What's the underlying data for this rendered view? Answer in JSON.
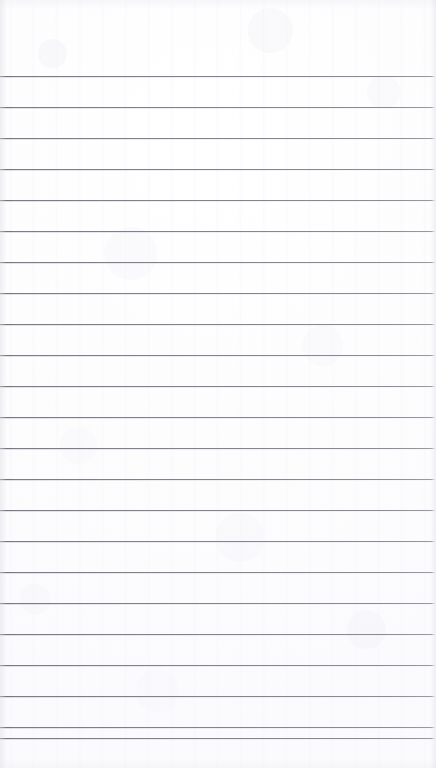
{
  "document": {
    "kind": "lined-paper-scan",
    "title": "Blank ruled notepad page",
    "page_width": 436,
    "page_height": 768,
    "paper_color": "#fdfdfe",
    "rule_color": "#83838d",
    "rule_thickness": 1,
    "rule_spacing": 31,
    "first_rule_y": 76,
    "last_rule_y": 738,
    "rule_count": 23,
    "top_margin": 76,
    "bottom_margin": 30,
    "left_margin": 0,
    "right_margin": 0,
    "has_margin_rule": false,
    "has_punch_holes": false,
    "has_header": false,
    "has_handwriting": false,
    "written_text": "",
    "rule_y_positions": [
      76,
      107,
      138,
      169,
      200,
      231,
      262,
      293,
      324,
      355,
      386,
      417,
      448,
      479,
      510,
      541,
      572,
      603,
      634,
      665,
      696,
      727,
      738
    ]
  }
}
